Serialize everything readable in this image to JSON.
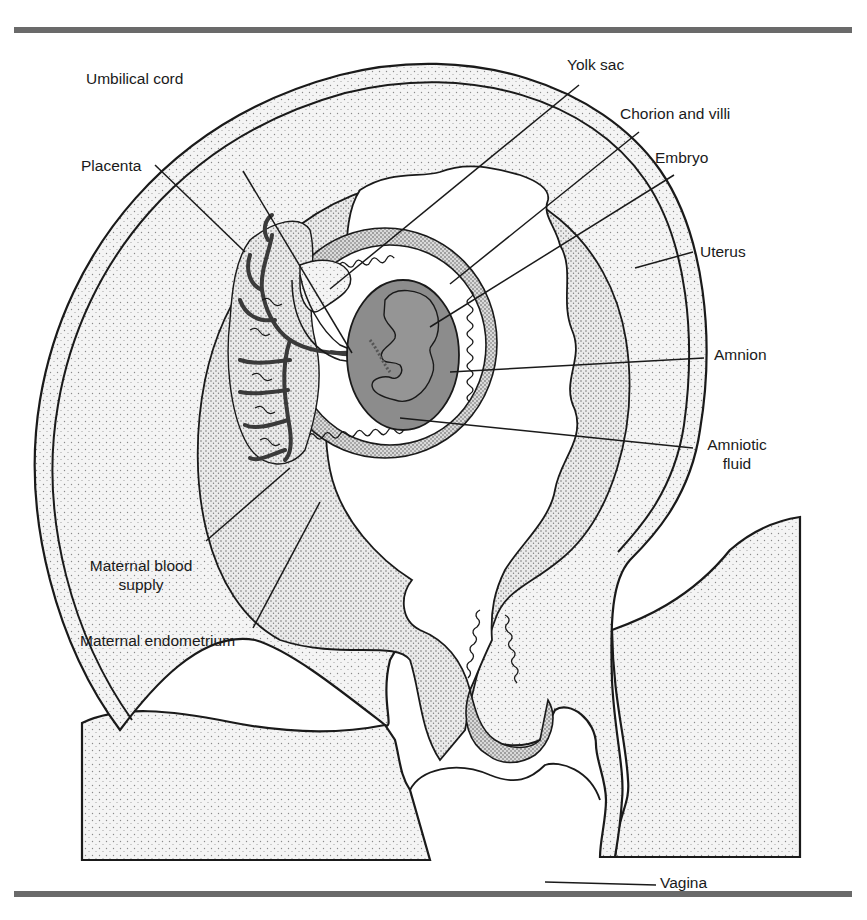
{
  "figure": {
    "type": "anatomical cross-section",
    "colors": {
      "ink": "#1a1a1a",
      "rule": "#6a6a6a",
      "stipple_light": "#e6e6e6",
      "stipple_dark": "#c9c9c9",
      "amniotic_fluid": "#8c8c8c",
      "placenta_vessels": "#3a3a3a"
    }
  },
  "labels": {
    "umbilical_cord": "Umbilical cord",
    "yolk_sac": "Yolk sac",
    "chorion_and_villi": "Chorion and villi",
    "embryo": "Embryo",
    "placenta": "Placenta",
    "uterus": "Uterus",
    "amnion": "Amnion",
    "amniotic_fluid_line1": "Amniotic",
    "amniotic_fluid_line2": "fluid",
    "maternal_blood_supply_line1": "Maternal blood",
    "maternal_blood_supply_line2": "supply",
    "maternal_endometrium": "Maternal endometrium",
    "vagina": "Vagina"
  }
}
